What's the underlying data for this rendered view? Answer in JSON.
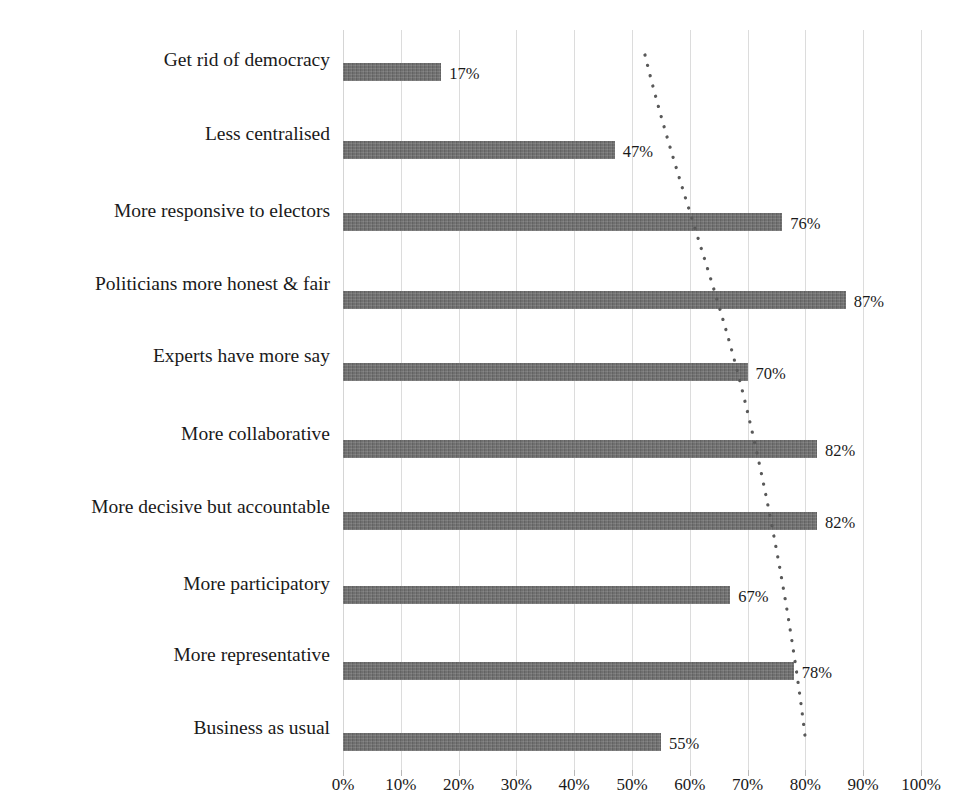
{
  "chart_data": {
    "type": "bar",
    "orientation": "horizontal",
    "title": "",
    "subtitle": "",
    "xlabel": "",
    "ylabel": "",
    "xlim": [
      0,
      100
    ],
    "grid": true,
    "legend": null,
    "categories": [
      "Get rid of democracy",
      "Less centralised",
      "More responsive to electors",
      "Politicians more honest & fair",
      "Experts have more say",
      "More collaborative",
      "More decisive but accountable",
      "More participatory",
      "More representative",
      "Business as usual"
    ],
    "values": [
      17,
      47,
      76,
      87,
      70,
      82,
      82,
      67,
      78,
      55
    ],
    "value_labels": [
      "17%",
      "47%",
      "76%",
      "87%",
      "70%",
      "82%",
      "82%",
      "67%",
      "78%",
      "55%"
    ],
    "x_ticks": [
      0,
      10,
      20,
      30,
      40,
      50,
      60,
      70,
      80,
      90,
      100
    ],
    "x_tick_labels": [
      "0%",
      "10%",
      "20%",
      "30%",
      "40%",
      "50%",
      "60%",
      "70%",
      "80%",
      "90%",
      "100%"
    ],
    "bar_color": "#6e6e6e",
    "gridline_color": "#dcdcdc",
    "text_color": "#1a1a1a",
    "annotations": [
      {
        "name": "trend-line",
        "style": "dotted",
        "color": "#595959",
        "description": "dotted curve descending from upper-middle to lower-right across the bars"
      }
    ]
  },
  "axis": {
    "x_tick_labels": [
      "0%",
      "10%",
      "20%",
      "30%",
      "40%",
      "50%",
      "60%",
      "70%",
      "80%",
      "90%",
      "100%"
    ]
  }
}
